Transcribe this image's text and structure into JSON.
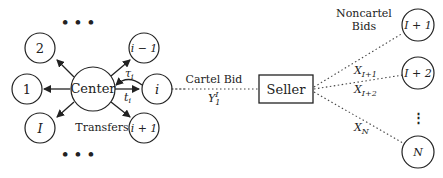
{
  "diagram": {
    "center": {
      "label": "Center"
    },
    "cartel_nodes": [
      {
        "id": "node-2",
        "label": "2"
      },
      {
        "id": "node-1",
        "label": "1"
      },
      {
        "id": "node-I",
        "label": "I"
      },
      {
        "id": "node-i-minus-1",
        "label": "i − 1"
      },
      {
        "id": "node-i",
        "label": "i"
      },
      {
        "id": "node-i-plus-1",
        "label": "i + 1"
      }
    ],
    "ellipsis_top": "• • •",
    "ellipsis_bottom": "• • •",
    "ellipsis_right": "···",
    "tau_label": "τ",
    "tau_sub": "i",
    "t_label": "t",
    "t_sub": "i",
    "transfers_label": "Transfers",
    "cartel_bid_label": "Cartel Bid",
    "cartel_bid_value": "Y",
    "cartel_bid_sub": "1",
    "cartel_bid_sup": "I",
    "seller_label": "Seller",
    "noncartel_title_line1": "Noncartel",
    "noncartel_title_line2": "Bids",
    "noncartel_nodes": [
      {
        "id": "node-I-plus-1",
        "label": "I + 1"
      },
      {
        "id": "node-I-plus-2",
        "label": "I + 2"
      },
      {
        "id": "node-N",
        "label": "N"
      }
    ],
    "bids": [
      {
        "var": "X",
        "sub": "I+1"
      },
      {
        "var": "X",
        "sub": "I+2"
      },
      {
        "var": "X",
        "sub": "N"
      }
    ],
    "vertical_ellipsis": "⋮"
  }
}
